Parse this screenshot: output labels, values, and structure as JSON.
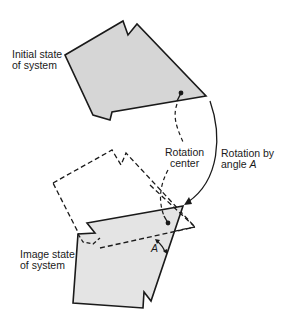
{
  "diagram": {
    "labels": {
      "initial_line1": "Initial state",
      "initial_line2": "of system",
      "image_line1": "Image state",
      "image_line2": "of system",
      "center_line1": "Rotation",
      "center_line2": "center",
      "rotation_line1": "Rotation by",
      "rotation_line2_prefix": "angle ",
      "rotation_angle_symbol": "A",
      "angle_label": "A"
    },
    "colors": {
      "shape_fill": "#d6d6d6",
      "stroke": "#1a1a1a",
      "background": "#ffffff"
    }
  }
}
